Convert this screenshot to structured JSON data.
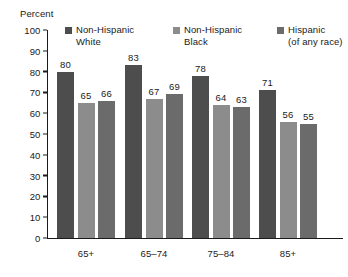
{
  "chart_data": {
    "type": "bar",
    "title": "",
    "subtitle": "",
    "xlabel": "",
    "ylabel": "Percent",
    "ylim": [
      0,
      100
    ],
    "yticks": [
      100,
      90,
      80,
      70,
      60,
      50,
      40,
      30,
      20,
      10,
      0
    ],
    "grid": false,
    "legend_position": "top-inside",
    "categories": [
      "65+",
      "65–74",
      "75–84",
      "85+"
    ],
    "series": [
      {
        "name": "Non-Hispanic White",
        "color": "#4d4d4d",
        "values": [
          80,
          83,
          78,
          71
        ]
      },
      {
        "name": "Non-Hispanic Black",
        "color": "#8c8c8c",
        "values": [
          65,
          67,
          64,
          56
        ]
      },
      {
        "name": "Hispanic (of any race)",
        "color": "#6b6b6b",
        "values": [
          66,
          69,
          63,
          55
        ]
      }
    ]
  },
  "legend": {
    "items": [
      {
        "label": "Non-Hispanic\nWhite",
        "color": "#4d4d4d"
      },
      {
        "label": "Non-Hispanic\nBlack",
        "color": "#8c8c8c"
      },
      {
        "label": "Hispanic\n(of any race)",
        "color": "#6b6b6b"
      }
    ]
  },
  "axis": {
    "y_title": "Percent"
  },
  "colors": {
    "axis": "#1a1a1a",
    "text": "#1a1a1a",
    "background": "#ffffff"
  }
}
